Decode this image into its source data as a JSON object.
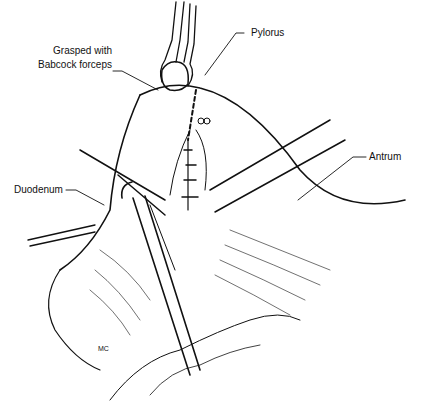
{
  "figure": {
    "labels": {
      "pylorus": "Pylorus",
      "grasped_line1": "Grasped with",
      "grasped_line2": "Babcock forceps",
      "antrum": "Antrum",
      "duodenum": "Duodenum",
      "signature": "MC"
    }
  }
}
